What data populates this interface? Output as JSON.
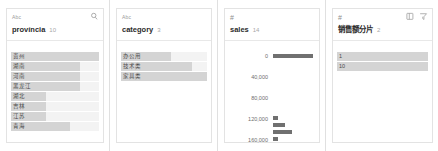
{
  "panels": [
    {
      "type_indicator": "Abc",
      "field_name": "província",
      "distinct_count": "10",
      "icons": [
        "search-icon"
      ],
      "values": [
        {
          "label": "贵州",
          "bar_pct": 100
        },
        {
          "label": "湖南",
          "bar_pct": 78
        },
        {
          "label": "河南",
          "bar_pct": 78
        },
        {
          "label": "黑龙江",
          "bar_pct": 78
        },
        {
          "label": "湖北",
          "bar_pct": 40
        },
        {
          "label": "吉林",
          "bar_pct": 40
        },
        {
          "label": "江苏",
          "bar_pct": 40
        },
        {
          "label": "青海",
          "bar_pct": 67
        }
      ]
    },
    {
      "type_indicator": "Abc",
      "field_name": "category",
      "distinct_count": "3",
      "icons": [],
      "values": [
        {
          "label": "办公用",
          "bar_pct": 58
        },
        {
          "label": "技术类",
          "bar_pct": 82
        },
        {
          "label": "家具类",
          "bar_pct": 100
        }
      ]
    },
    {
      "type_indicator": "#",
      "field_name": "sales",
      "distinct_count": "14",
      "icons": [],
      "axis_ticks": [
        "0",
        "40,000",
        "80,000",
        "120,000",
        "160,000"
      ],
      "bars": [
        {
          "value_pos": 0,
          "bar_pct": 100
        },
        {
          "value_pos": 118000,
          "bar_pct": 13
        },
        {
          "value_pos": 132000,
          "bar_pct": 30
        },
        {
          "value_pos": 145000,
          "bar_pct": 48
        },
        {
          "value_pos": 158000,
          "bar_pct": 13
        }
      ],
      "axis_min": 0,
      "axis_max": 170000
    },
    {
      "type_indicator": "#",
      "field_name": "销售额分片",
      "distinct_count": "2",
      "icons": [
        "table-icon",
        "filter-icon"
      ],
      "values": [
        {
          "label": "1",
          "bar_pct": 100
        },
        {
          "label": "10",
          "bar_pct": 100
        }
      ]
    }
  ],
  "colors": {
    "bar_light": "#d4d4d4",
    "bar_track": "#f3f3f3",
    "bar_dark": "#707070",
    "border": "#e3e3e3",
    "text": "#2b2b2b",
    "muted": "#a8a8a8"
  }
}
